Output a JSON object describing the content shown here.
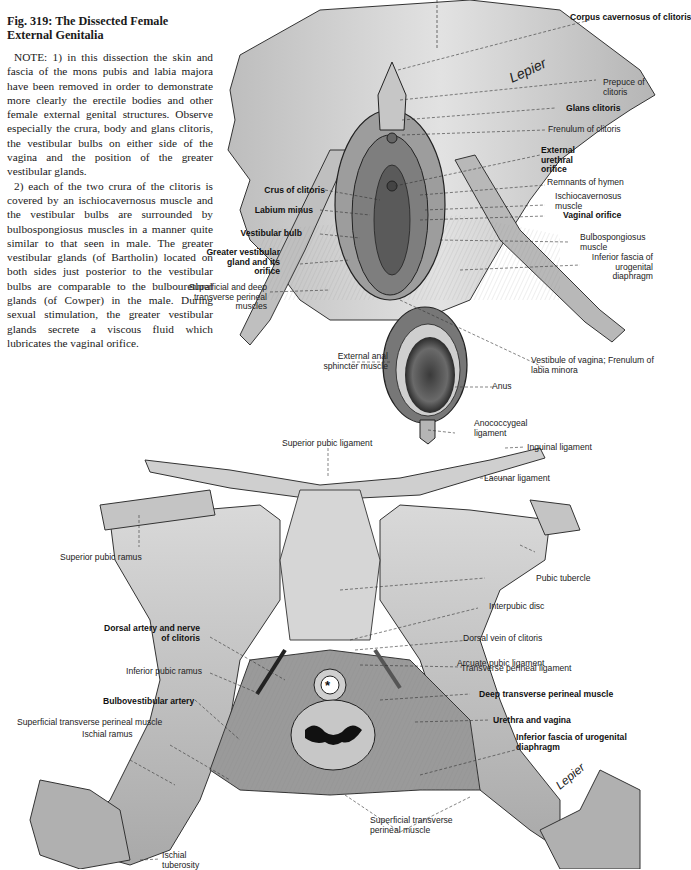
{
  "caption": {
    "title": "Fig. 319: The Dissected Female External Genitalia",
    "paragraphs": [
      "NOTE: 1) in this dissection the skin and fascia of the mons pubis and labia majora have been removed in order to demonstrate more clearly the erectile bodies and other female external genital structures. Observe especially the crura, body and glans clitoris, the vestibular bulbs on either side of the vagina and the position of the greater vestibular glands.",
      "2) each of the two crura of the clitoris is covered by an ischiocavernosus muscle and the vestibular bulbs are surrounded by bulbospongiosus muscles in a manner quite similar to that seen in male. The greater vestibular glands (of Bartholin) located on both sides just posterior to the vestibular bulbs are comparable to the bulbourethral glands (of Cowper) in the male. During sexual stimulation, the greater vestibular glands secrete a viscous fluid which lubricates the vaginal orifice."
    ]
  },
  "upper_figure": {
    "labels": {
      "corpus_cavernosus": "Corpus cavernosus of clitoris",
      "prepuce": "Prepuce of clitoris",
      "glans": "Glans clitoris",
      "frenulum_clitoris": "Frenulum of clitoris",
      "ext_urethral_orifice": "External urethral orifice",
      "remnants_hymen": "Remnants of hymen",
      "ischiocavernosus": "Ischiocavernosus muscle",
      "vaginal_orifice": "Vaginal orifice",
      "bulbospongiosus": "Bulbospongiosus muscle",
      "inferior_fascia": "Inferior fascia of urogenital diaphragm",
      "crus": "Crus of clitoris",
      "labium_minus": "Labium minus",
      "vestibular_bulb": "Vestibular bulb",
      "greater_vestibular_gland": "Greater vestibular gland and its orifice",
      "sup_deep_transverse": "Superficial and deep transverse perineal muscles",
      "ext_anal_sphincter": "External anal sphincter muscle",
      "vestibule": "Vestibule of vagina; Frenulum of labia minora",
      "anus": "Anus",
      "anococcygeal": "Anococcygeal ligament"
    },
    "signature": "Lepier"
  },
  "lower_figure": {
    "labels": {
      "superior_pubic_ligament": "Superior pubic ligament",
      "inguinal_ligament": "Inguinal ligament",
      "lacunar_ligament": "Lacunar ligament",
      "superior_pubic_ramus": "Superior pubic ramus",
      "pubic_tubercle": "Pubic tubercle",
      "interpubic_disc": "Interpubic disc",
      "dorsal_vein": "Dorsal vein of clitoris",
      "dorsal_artery": "Dorsal artery and nerve of clitoris",
      "arcuate": "Arcuate pubic ligament",
      "inferior_pubic_ramus": "Inferior pubic ramus",
      "transverse_perineal_lig": "Transverse perineal ligament",
      "bulbovestibular": "Bulbovestibular artery",
      "deep_transverse": "Deep transverse perineal muscle",
      "urethra_vagina": "Urethra and vagina",
      "sup_transverse_left": "Superficial transverse perineal muscle",
      "ischial_ramus": "Ischial ramus",
      "inferior_fascia_uro": "Inferior fascia of urogenital diaphragm",
      "sup_transverse_bottom": "Superficial transverse perineal muscle",
      "ischial_tuberosity": "Ischial tuberosity"
    },
    "signature": "Lepier"
  }
}
